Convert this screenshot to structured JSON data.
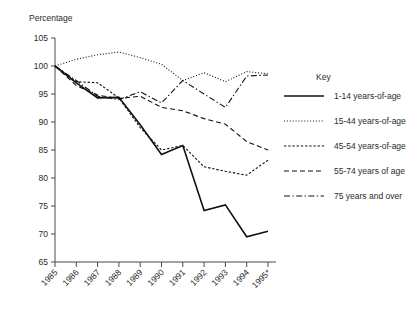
{
  "chart_data": {
    "type": "line",
    "title": "",
    "ylabel": "Percentage",
    "xlabel": "",
    "ylim": [
      65,
      105
    ],
    "yticks": [
      65,
      70,
      75,
      80,
      85,
      90,
      95,
      100,
      105
    ],
    "grid": false,
    "legend_position": "right",
    "legend_title": "Key",
    "categories": [
      "1985",
      "1986",
      "1987",
      "1988",
      "1989",
      "1990",
      "1991",
      "1992",
      "1993",
      "1994",
      "1995*"
    ],
    "x": [
      1985,
      1986,
      1987,
      1988,
      1989,
      1990,
      1991,
      1992,
      1993,
      1994,
      1995
    ],
    "series": [
      {
        "name": "1-14 years-of-age",
        "style": "solid",
        "values": [
          100.0,
          97.0,
          94.3,
          94.4,
          89.5,
          84.2,
          85.8,
          74.2,
          75.2,
          69.5,
          70.5
        ]
      },
      {
        "name": "15-44 years-of-age",
        "style": "dotted",
        "values": [
          100.0,
          101.2,
          102.0,
          102.5,
          101.5,
          100.3,
          97.4,
          98.8,
          97.2,
          99.0,
          98.6
        ]
      },
      {
        "name": "45-54 years-of-age",
        "style": "fine-dashed",
        "values": [
          100.0,
          97.2,
          97.0,
          94.3,
          89.0,
          85.0,
          85.8,
          82.0,
          81.2,
          80.5,
          83.2
        ]
      },
      {
        "name": "55-74 years of age",
        "style": "dashed",
        "values": [
          100.0,
          96.5,
          94.8,
          94.2,
          94.6,
          92.6,
          92.0,
          90.6,
          89.6,
          86.5,
          85.0
        ]
      },
      {
        "name": "75 years and over",
        "style": "dash-dot",
        "values": [
          100.0,
          97.4,
          94.6,
          94.0,
          95.4,
          93.4,
          97.4,
          95.0,
          92.6,
          98.2,
          98.4
        ]
      }
    ]
  },
  "axis": {
    "y_title": "Percentage"
  },
  "legend": {
    "title": "Key",
    "items": [
      {
        "label": "1-14 years-of-age",
        "style": "solid"
      },
      {
        "label": "15-44 years-of-age",
        "style": "dotted"
      },
      {
        "label": "45-54 years-of-age",
        "style": "fine-dashed"
      },
      {
        "label": "55-74 years of age",
        "style": "dashed"
      },
      {
        "label": "75 years and over",
        "style": "dash-dot"
      }
    ]
  },
  "caption": {
    "text": ""
  }
}
